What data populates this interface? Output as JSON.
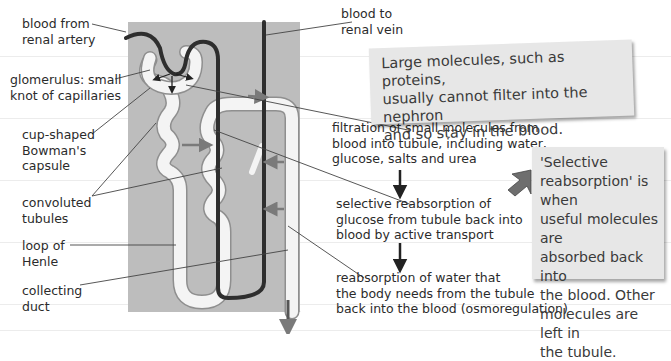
{
  "diagram": {
    "colors": {
      "background_panel": "#bdbdbd",
      "tubule_fill": "#f4f4f4",
      "blood_vessel": "#2e2e2e",
      "reabsorption_arrow": "#7a7a7a",
      "note_box": "#e7e7e7",
      "text": "#2b2b2b"
    },
    "left_labels": [
      {
        "id": "renal-artery",
        "lines": [
          "blood from",
          "renal artery"
        ]
      },
      {
        "id": "glomerulus",
        "lines": [
          "glomerulus: small",
          "knot of capillaries"
        ]
      },
      {
        "id": "bowmans-capsule",
        "lines": [
          "cup-shaped",
          "Bowman's",
          "capsule"
        ]
      },
      {
        "id": "convoluted-tubules",
        "lines": [
          "convoluted",
          "tubules"
        ]
      },
      {
        "id": "loop-of-henle",
        "lines": [
          "loop of",
          "Henle"
        ]
      },
      {
        "id": "collecting-duct",
        "lines": [
          "collecting",
          "duct"
        ]
      }
    ],
    "top_label": {
      "id": "renal-vein",
      "lines": [
        "blood to",
        "renal vein"
      ]
    },
    "process_steps": [
      {
        "id": "filtration",
        "lines": [
          "filtration of small molecules from",
          "blood into tubule, including water,",
          "glucose, salts and urea"
        ]
      },
      {
        "id": "selective-reabsorption",
        "lines": [
          "selective reabsorption of",
          "glucose from tubule back into",
          "blood by active transport"
        ]
      },
      {
        "id": "water-reabsorption",
        "lines": [
          "reabsorption of water that",
          "the body needs from the tubule",
          "back into the blood (osmoregulation)"
        ]
      }
    ],
    "notes": [
      {
        "id": "large-molecules-note",
        "lines": [
          "Large molecules, such as proteins,",
          "usually cannot filter into the nephron",
          "and so stay in the blood."
        ]
      },
      {
        "id": "selective-reabsorption-note",
        "lines": [
          "'Selective",
          "reabsorption' is when",
          "useful molecules are",
          "absorbed back into",
          "the blood. Other",
          "molecules are left in",
          "the tubule."
        ]
      }
    ]
  }
}
